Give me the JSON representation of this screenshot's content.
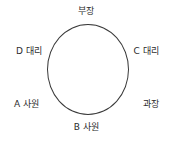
{
  "diagram": {
    "type": "round-table-seating",
    "shape": "circle",
    "stroke_color": "#3a3a3a",
    "background_color": "#ffffff",
    "text_color": "#2b2b2b",
    "seats": [
      {
        "id": "seat-top",
        "position": "top",
        "label": "부장"
      },
      {
        "id": "seat-right-upper",
        "position": "right-upper",
        "label": "C 대리"
      },
      {
        "id": "seat-right-lower",
        "position": "right-lower",
        "label": "과장"
      },
      {
        "id": "seat-bottom",
        "position": "bottom",
        "label": "B 사원"
      },
      {
        "id": "seat-left-lower",
        "position": "left-lower",
        "label": "A 사원"
      },
      {
        "id": "seat-left-upper",
        "position": "left-upper",
        "label": "D 대리"
      }
    ]
  }
}
